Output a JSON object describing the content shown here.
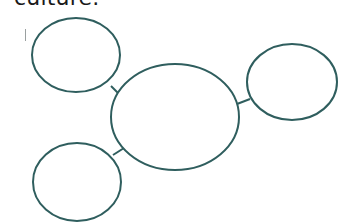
{
  "caption": {
    "text": "culture."
  },
  "diagram": {
    "type": "bubble-map",
    "stroke_color": "#2f5e5e",
    "nodes": [
      {
        "id": "center",
        "label": "",
        "cx": 175,
        "cy": 117,
        "rx": 64,
        "ry": 53
      },
      {
        "id": "top-left",
        "label": "",
        "cx": 76,
        "cy": 55,
        "rx": 44,
        "ry": 37
      },
      {
        "id": "right",
        "label": "",
        "cx": 292,
        "cy": 82,
        "rx": 45,
        "ry": 38
      },
      {
        "id": "bottom-left",
        "label": "",
        "cx": 77,
        "cy": 182,
        "rx": 44,
        "ry": 39
      }
    ],
    "edges": [
      {
        "from": "center",
        "to": "top-left"
      },
      {
        "from": "center",
        "to": "right"
      },
      {
        "from": "center",
        "to": "bottom-left"
      }
    ]
  }
}
